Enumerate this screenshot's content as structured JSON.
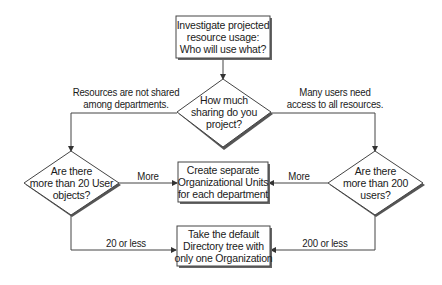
{
  "diagram": {
    "type": "flowchart",
    "colors": {
      "stroke": "#333333",
      "shadow": "#555555",
      "fill": "#ffffff",
      "text": "#1a1a1a"
    },
    "nodes": {
      "start": {
        "shape": "rectangle",
        "lines": [
          "Investigate projected",
          "resource usage:",
          "Who will use what?"
        ]
      },
      "sharing_decision": {
        "shape": "diamond",
        "lines": [
          "How much",
          "sharing do you",
          "project?"
        ]
      },
      "user_objects_decision": {
        "shape": "diamond",
        "lines": [
          "Are there",
          "more than 20 User",
          "objects?"
        ]
      },
      "users_decision": {
        "shape": "diamond",
        "lines": [
          "Are there",
          "more than 200",
          "users?"
        ]
      },
      "separate_ous": {
        "shape": "rectangle",
        "lines": [
          "Create separate",
          "Organizational Units",
          "for each department"
        ]
      },
      "default_tree": {
        "shape": "rectangle",
        "lines": [
          "Take the default",
          "Directory tree with",
          "only one Organization"
        ]
      }
    },
    "edges": {
      "not_shared": {
        "from": "sharing_decision",
        "to": "user_objects_decision",
        "lines": [
          "Resources are not shared",
          "among departments."
        ]
      },
      "many_users": {
        "from": "sharing_decision",
        "to": "users_decision",
        "lines": [
          "Many users need",
          "access to all resources."
        ]
      },
      "left_more": {
        "from": "user_objects_decision",
        "to": "separate_ous",
        "label": "More"
      },
      "right_more": {
        "from": "users_decision",
        "to": "separate_ous",
        "label": "More"
      },
      "left_less": {
        "from": "user_objects_decision",
        "to": "default_tree",
        "label": "20 or less"
      },
      "right_less": {
        "from": "users_decision",
        "to": "default_tree",
        "label": "200 or less"
      },
      "start_to_sharing": {
        "from": "start",
        "to": "sharing_decision",
        "label": ""
      }
    }
  }
}
